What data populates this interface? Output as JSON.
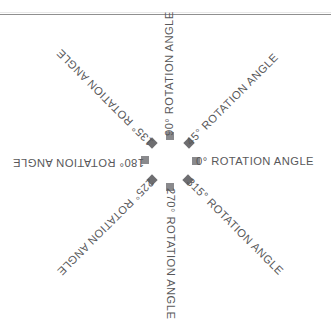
{
  "figure": {
    "title": "",
    "background_color": "#ffffff",
    "text_color": "#58585a",
    "marker_square_color": "#8a8a8d",
    "marker_diamond_color": "#6e6e71",
    "rule_color": "#8f8f8f"
  },
  "chart_data": {
    "type": "scatter",
    "title": "",
    "subtitle": "",
    "xlabel": "",
    "ylabel": "",
    "grid": false,
    "legend": "none",
    "center": {
      "x": 170,
      "y": 162
    },
    "angles_deg": [
      0,
      45,
      90,
      135,
      180,
      225,
      270,
      315
    ],
    "labels": [
      "0° ROTATION ANGLE",
      "45° ROTATION ANGLE",
      "90° ROTATION ANGLE",
      "135° ROTATION ANGLE",
      "180° ROTATION ANGLE",
      "225° ROTATION ANGLE",
      "270° ROTATION ANGLE",
      "315° ROTATION ANGLE"
    ],
    "series": [
      {
        "name": "rotation markers",
        "points": [
          {
            "angle": 0,
            "label": "0° ROTATION ANGLE",
            "marker": "square",
            "x": 196,
            "y": 161
          },
          {
            "angle": 45,
            "label": "45° ROTATION ANGLE",
            "marker": "diamond",
            "x": 189,
            "y": 143
          },
          {
            "angle": 90,
            "label": "90° ROTATION ANGLE",
            "marker": "square",
            "x": 170,
            "y": 136
          },
          {
            "angle": 135,
            "label": "135° ROTATION ANGLE",
            "marker": "diamond",
            "x": 152,
            "y": 143
          },
          {
            "angle": 180,
            "label": "180° ROTATION ANGLE",
            "marker": "square",
            "x": 145,
            "y": 160
          },
          {
            "angle": 225,
            "label": "225° ROTATION ANGLE",
            "marker": "diamond",
            "x": 152,
            "y": 180
          },
          {
            "angle": 270,
            "label": "270° ROTATION ANGLE",
            "marker": "square",
            "x": 170,
            "y": 187
          },
          {
            "angle": 315,
            "label": "315° ROTATION ANGLE",
            "marker": "diamond",
            "x": 188,
            "y": 180
          }
        ]
      }
    ]
  },
  "spokes": [
    {
      "angle_label": "0",
      "text": "0° ROTATION ANGLE",
      "rotation": 0,
      "marker": "square"
    },
    {
      "angle_label": "45",
      "text": "45° ROTATION ANGLE",
      "rotation": -45,
      "marker": "diamond"
    },
    {
      "angle_label": "90",
      "text": "90° ROTATION ANGLE",
      "rotation": -90,
      "marker": "square"
    },
    {
      "angle_label": "135",
      "text": "135° ROTATION ANGLE",
      "rotation": -135,
      "marker": "diamond"
    },
    {
      "angle_label": "180",
      "text": "180° ROTATION ANGLE",
      "rotation": 180,
      "marker": "square"
    },
    {
      "angle_label": "225",
      "text": "225° ROTATION ANGLE",
      "rotation": 135,
      "marker": "diamond"
    },
    {
      "angle_label": "270",
      "text": "270° ROTATION ANGLE",
      "rotation": 90,
      "marker": "square"
    },
    {
      "angle_label": "315",
      "text": "315° ROTATION ANGLE",
      "rotation": 45,
      "marker": "diamond"
    }
  ]
}
